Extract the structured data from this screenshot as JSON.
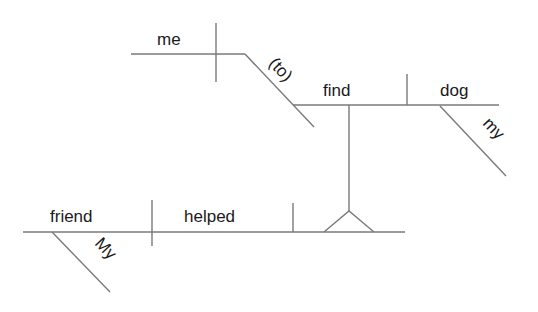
{
  "diagram": {
    "type": "Reed-Kellogg sentence diagram",
    "sentence_words": {
      "subject": "friend",
      "subject_modifier": "My",
      "verb": "helped",
      "object_complement_infinitive": "find",
      "infinitive_subject": "me",
      "infinitive_marker": "(to)",
      "infinitive_object": "dog",
      "object_modifier": "my"
    },
    "colors": {
      "line": "#7a7a7a",
      "text": "#1a1a1a",
      "background": "#ffffff"
    }
  }
}
